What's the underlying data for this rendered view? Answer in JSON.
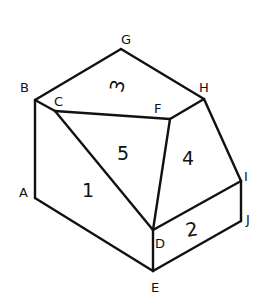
{
  "diagram": {
    "title": "",
    "vertices": {
      "A": {
        "label": "A",
        "x": 35,
        "y": 198,
        "lx": 19,
        "ly": 197
      },
      "B": {
        "label": "B",
        "x": 35,
        "y": 100,
        "lx": 20,
        "ly": 92
      },
      "C": {
        "label": "C",
        "x": 55,
        "y": 111,
        "lx": 54,
        "ly": 106
      },
      "D": {
        "label": "D",
        "x": 153,
        "y": 230,
        "lx": 155,
        "ly": 248
      },
      "E": {
        "label": "E",
        "x": 153,
        "y": 271,
        "lx": 151,
        "ly": 292
      },
      "F": {
        "label": "F",
        "x": 170,
        "y": 119,
        "lx": 154,
        "ly": 113
      },
      "G": {
        "label": "G",
        "x": 121,
        "y": 49,
        "lx": 121,
        "ly": 44
      },
      "H": {
        "label": "H",
        "x": 204,
        "y": 99,
        "lx": 199,
        "ly": 92
      },
      "I": {
        "label": "I",
        "x": 241,
        "y": 181,
        "lx": 244,
        "ly": 181
      },
      "J": {
        "label": "J",
        "x": 241,
        "y": 221,
        "lx": 246,
        "ly": 224
      }
    },
    "faces": [
      {
        "label": "1",
        "x": 88,
        "y": 197,
        "rotate": 0
      },
      {
        "label": "2",
        "x": 192,
        "y": 236,
        "rotate": -10
      },
      {
        "label": "3",
        "x": 118,
        "y": 92,
        "rotate": -75
      },
      {
        "label": "4",
        "x": 188,
        "y": 165,
        "rotate": 0
      },
      {
        "label": "5",
        "x": 123,
        "y": 160,
        "rotate": 0
      }
    ],
    "edges": [
      [
        "A",
        "B"
      ],
      [
        "B",
        "G"
      ],
      [
        "G",
        "H"
      ],
      [
        "B",
        "C"
      ],
      [
        "C",
        "F"
      ],
      [
        "F",
        "H"
      ],
      [
        "C",
        "D"
      ],
      [
        "F",
        "D"
      ],
      [
        "H",
        "I"
      ],
      [
        "I",
        "J"
      ],
      [
        "D",
        "I"
      ],
      [
        "D",
        "E"
      ],
      [
        "E",
        "J"
      ],
      [
        "A",
        "E"
      ]
    ]
  }
}
